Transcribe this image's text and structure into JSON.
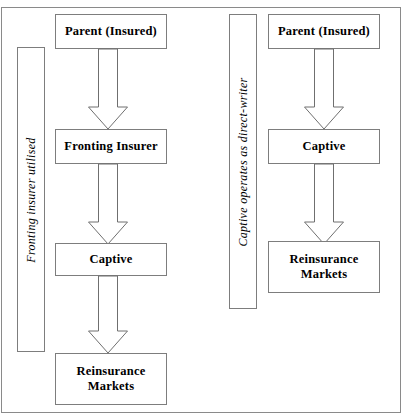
{
  "figure": {
    "clipped_title": "Figure",
    "background_color": "#ffffff",
    "border_color": "#8a8a8a",
    "box_border_color": "#7d7d7d",
    "arrow_stroke_color": "#6f6f6f",
    "arrow_fill_color": "#ffffff",
    "text_color": "#000000"
  },
  "left_panel": {
    "side_label": "Fronting insurer utilised",
    "nodes": [
      {
        "id": "parent",
        "label": "Parent (Insured)"
      },
      {
        "id": "fronting-insurer",
        "label": "Fronting Insurer"
      },
      {
        "id": "captive",
        "label": "Captive"
      },
      {
        "id": "reinsurance-markets",
        "label": "Reinsurance\nMarkets"
      }
    ],
    "arrows": [
      {
        "from": "parent",
        "to": "fronting-insurer"
      },
      {
        "from": "fronting-insurer",
        "to": "captive"
      },
      {
        "from": "captive",
        "to": "reinsurance-markets"
      }
    ]
  },
  "right_panel": {
    "side_label": "Captive operates as direct-writer",
    "nodes": [
      {
        "id": "parent",
        "label": "Parent (Insured)"
      },
      {
        "id": "captive",
        "label": "Captive"
      },
      {
        "id": "reinsurance-markets",
        "label": "Reinsurance\nMarkets"
      }
    ],
    "arrows": [
      {
        "from": "parent",
        "to": "captive"
      },
      {
        "from": "captive",
        "to": "reinsurance-markets"
      }
    ]
  }
}
